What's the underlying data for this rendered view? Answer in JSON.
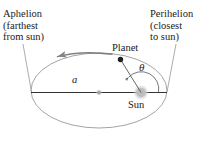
{
  "figure": {
    "background_color": "#ffffff",
    "width": 203,
    "height": 143
  },
  "labels": {
    "aphelion": {
      "line1": "Aphelion",
      "line2": "(farthest",
      "line3": "from sun)"
    },
    "perihelion": {
      "line1": "Perihelion",
      "line2": "(closest",
      "line3": "to sun)"
    },
    "planet": "Planet",
    "sun": "Sun",
    "semimajor_axis": "a",
    "angle": "θ"
  },
  "geometry": {
    "ellipse": {
      "center_x": 99,
      "center_y": 90.5,
      "radius_x": 68,
      "radius_y": 37.5,
      "stroke_color": "#9a9a9a",
      "stroke_width": 0.9
    },
    "major_axis_line": {
      "x1": 31,
      "y1": 92.5,
      "x2": 167,
      "y2": 92.5,
      "stroke_color": "#333333",
      "stroke_width": 1.0
    },
    "ellipse_center_dot": {
      "cx": 99,
      "cy": 92.5,
      "r": 2.2,
      "fill": "#a6a6a6"
    },
    "sun": {
      "cx": 141,
      "cy": 92.5,
      "r": 6.5,
      "fill": "#b8b8b8"
    },
    "planet_dot": {
      "cx": 120.5,
      "cy": 59.5,
      "r": 2.6,
      "fill": "#1f1f1f"
    },
    "radius_vector": {
      "x1": 141,
      "y1": 92.5,
      "x2": 120.5,
      "y2": 59.5,
      "stroke_color": "#555555",
      "stroke_width": 0.9
    },
    "angle_arc": {
      "radius": 18,
      "start_deg": 0,
      "end_deg": 122,
      "stroke_color": "#555555",
      "stroke_width": 0.8,
      "direction": "counterclockwise"
    },
    "orbit_direction_arrow": {
      "tip_x": 58,
      "tip_y": 56.5,
      "direction": "counterclockwise",
      "stroke_color": "#6e6e6e"
    },
    "leader_line_aphelion": {
      "x1": 23,
      "y1": 44,
      "x2": 31,
      "y2": 92.5,
      "stroke_color": "#8a8a8a",
      "stroke_width": 0.7
    },
    "leader_line_perihelion": {
      "x1": 176,
      "y1": 44,
      "x2": 167,
      "y2": 92.5,
      "stroke_color": "#8a8a8a",
      "stroke_width": 0.7
    }
  },
  "colors": {
    "text": "#1a1a1a",
    "orbit": "#9a9a9a",
    "axis": "#333333",
    "sun": "#b8b8b8",
    "planet": "#1f1f1f",
    "leader": "#8a8a8a"
  }
}
